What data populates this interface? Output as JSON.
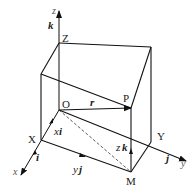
{
  "diagram": {
    "type": "3d-coordinate-box",
    "axes": {
      "x": {
        "label": "x",
        "unit_vector": "i"
      },
      "y": {
        "label": "y",
        "unit_vector": "j"
      },
      "z": {
        "label": "z",
        "unit_vector": "k"
      }
    },
    "points": {
      "origin": "O",
      "x_point": "X",
      "y_point": "Y",
      "z_point": "Z",
      "p_point": "P",
      "m_point": "M"
    },
    "vectors": {
      "position": "r",
      "x_component_coef": "x",
      "x_component_unit": "i",
      "y_component_coef": "y",
      "y_component_unit": "j",
      "z_component_coef": "z",
      "z_component_unit": "k"
    },
    "colors": {
      "line": "#111111",
      "dashed": "#333333",
      "text": "#222222"
    }
  }
}
